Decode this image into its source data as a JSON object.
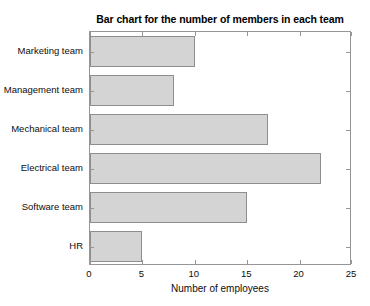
{
  "chart_data": {
    "type": "bar",
    "orientation": "horizontal",
    "title": "Bar chart for the number of members in each team",
    "xlabel": "Number of employees",
    "ylabel": "",
    "categories": [
      "Marketing team",
      "Management team",
      "Mechanical team",
      "Electrical team",
      "Software team",
      "HR"
    ],
    "values": [
      10,
      8,
      17,
      22,
      15,
      5
    ],
    "xlim": [
      0,
      25
    ],
    "xticks": [
      0,
      5,
      10,
      15,
      20,
      25
    ],
    "xtick_labels": [
      "0",
      "5",
      "10",
      "15",
      "20",
      "25"
    ],
    "grid": false,
    "legend": null,
    "colors": {
      "bar_fill": "#d4d4d4",
      "bar_edge": "#8e8e8e",
      "axis": "#969696",
      "text": "#0d0d0d",
      "background": "#ffffff"
    }
  }
}
